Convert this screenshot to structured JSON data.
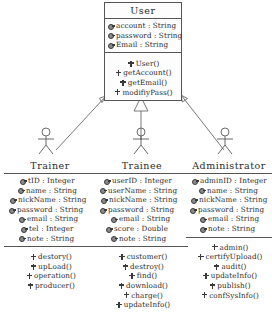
{
  "diagram": {
    "type": "uml-class-diagram",
    "title": "",
    "line_color": "#555555",
    "text_color": "#2b2b2b",
    "background": "#ffffff",
    "relationship": "generalization",
    "relationship_note": "Trainer, Trainee and Administrator generalize to User"
  },
  "classes": [
    {
      "id": "user",
      "name": "User",
      "shape": "box",
      "attributes": [
        {
          "visibility": "private",
          "text": "account : String"
        },
        {
          "visibility": "private",
          "text": "password : String"
        },
        {
          "visibility": "private",
          "text": "Email : String"
        }
      ],
      "operations": [
        {
          "visibility": "public",
          "text": "User()"
        },
        {
          "visibility": "public",
          "text": "getAccount()"
        },
        {
          "visibility": "public",
          "text": "getEmail()"
        },
        {
          "visibility": "public",
          "text": "modifiyPass()"
        }
      ]
    },
    {
      "id": "trainer",
      "name": "Trainer",
      "shape": "actor",
      "attributes": [
        {
          "visibility": "private",
          "text": "tID : Integer"
        },
        {
          "visibility": "private",
          "text": "name : String"
        },
        {
          "visibility": "private",
          "text": "nickName : String"
        },
        {
          "visibility": "private",
          "text": "password : String"
        },
        {
          "visibility": "private",
          "text": "email : String"
        },
        {
          "visibility": "private",
          "text": "tel : Integer"
        },
        {
          "visibility": "private",
          "text": "note : String"
        }
      ],
      "operations": [
        {
          "visibility": "public",
          "text": "destory()"
        },
        {
          "visibility": "public",
          "text": "upLoad()"
        },
        {
          "visibility": "public",
          "text": "operation()"
        },
        {
          "visibility": "public",
          "text": "producer()"
        }
      ]
    },
    {
      "id": "trainee",
      "name": "Trainee",
      "shape": "actor",
      "attributes": [
        {
          "visibility": "private",
          "text": "userID : Integer"
        },
        {
          "visibility": "private",
          "text": "userName : String"
        },
        {
          "visibility": "private",
          "text": "nickName : String"
        },
        {
          "visibility": "private",
          "text": "password : String"
        },
        {
          "visibility": "private",
          "text": "email : String"
        },
        {
          "visibility": "private",
          "text": "score : Double"
        },
        {
          "visibility": "private",
          "text": "note : String"
        }
      ],
      "operations": [
        {
          "visibility": "public",
          "text": "customer()"
        },
        {
          "visibility": "public",
          "text": "destroy()"
        },
        {
          "visibility": "public",
          "text": "find()"
        },
        {
          "visibility": "public",
          "text": "download()"
        },
        {
          "visibility": "public",
          "text": "charge()"
        },
        {
          "visibility": "public",
          "text": "updateInfo()"
        }
      ]
    },
    {
      "id": "administrator",
      "name": "Administrator",
      "shape": "actor",
      "attributes": [
        {
          "visibility": "private",
          "text": "adminID : Integer"
        },
        {
          "visibility": "private",
          "text": "name : String"
        },
        {
          "visibility": "private",
          "text": "nickName : String"
        },
        {
          "visibility": "private",
          "text": "password : String"
        },
        {
          "visibility": "private",
          "text": "email : String"
        },
        {
          "visibility": "private",
          "text": "note : String"
        }
      ],
      "operations": [
        {
          "visibility": "public",
          "text": "admin()"
        },
        {
          "visibility": "public",
          "text": "certifyUpload()"
        },
        {
          "visibility": "public",
          "text": "audit()"
        },
        {
          "visibility": "public",
          "text": "updateInfo()"
        },
        {
          "visibility": "public",
          "text": "publish()"
        },
        {
          "visibility": "public",
          "text": "confSysInfo()"
        }
      ]
    }
  ]
}
